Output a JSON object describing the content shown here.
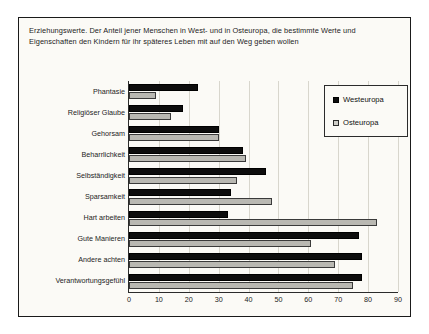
{
  "caption": "Erziehungswerte. Der Anteil jener Menschen in West- und in Osteuropa, die bestimmte Werte und Eigenschaften den Kindern für ihr späteres Leben mit auf den Weg geben wollen",
  "legend": {
    "items": [
      {
        "label": "Westeuropa",
        "swatch": "filled-black-square-icon",
        "color": "#0d0d0d"
      },
      {
        "label": "Osteuropa",
        "swatch": "outlined-gray-square-icon",
        "color": "#cfcec8"
      }
    ]
  },
  "chart_data": {
    "type": "bar",
    "orientation": "horizontal",
    "title": "Erziehungswerte. Der Anteil jener Menschen in West- und in Osteuropa, die bestimmte Werte und Eigenschaften den Kindern für ihr späteres Leben mit auf den Weg geben wollen",
    "xlabel": "",
    "ylabel": "",
    "xlim": [
      0,
      90
    ],
    "xticks": [
      0,
      10,
      20,
      30,
      40,
      50,
      60,
      70,
      80,
      90
    ],
    "grid": true,
    "legend_position": "top-right",
    "categories": [
      "Phantasie",
      "Religiöser Glaube",
      "Gehorsam",
      "Beharrlichkeit",
      "Selbständigkeit",
      "Sparsamkeit",
      "Hart arbeiten",
      "Gute Manieren",
      "Andere achten",
      "Verantwortungsgefühl"
    ],
    "series": [
      {
        "name": "Westeuropa",
        "color": "#0d0d0d",
        "values": [
          23,
          18,
          30,
          38,
          46,
          34,
          33,
          77,
          78,
          78
        ]
      },
      {
        "name": "Osteuropa",
        "color": "#b9b8b2",
        "values": [
          9,
          14,
          30,
          39,
          36,
          48,
          83,
          61,
          69,
          75
        ]
      }
    ]
  }
}
